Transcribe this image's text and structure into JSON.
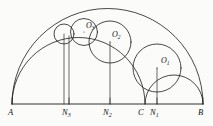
{
  "figure": {
    "background_color": "#fbfbfa",
    "ink_color": "#1a1a1a"
  },
  "chart_data": {
    "type": "diagram",
    "xlabel": "",
    "ylabel": "",
    "baseline": {
      "from_point": "A",
      "to_point": "B",
      "y": 104,
      "x_start": 12,
      "x_end": 203
    },
    "points": [
      {
        "id": "A",
        "label": "A",
        "x": 12,
        "y": 104,
        "label_x": 9,
        "label_y": 107
      },
      {
        "id": "N3",
        "label": "N3",
        "x": 69,
        "y": 104,
        "label_x": 63,
        "label_y": 107
      },
      {
        "id": "N2",
        "label": "N2",
        "x": 110,
        "y": 104,
        "label_x": 104,
        "label_y": 107
      },
      {
        "id": "C",
        "label": "C",
        "x": 145,
        "y": 104,
        "label_x": 140,
        "label_y": 107
      },
      {
        "id": "N1",
        "label": "N1",
        "x": 157,
        "y": 104,
        "label_x": 151,
        "label_y": 107
      },
      {
        "id": "B",
        "label": "B",
        "x": 203,
        "y": 104,
        "label_x": 199,
        "label_y": 107
      }
    ],
    "semicircles": [
      {
        "name": "outer-semicircle-AB",
        "from": "A",
        "to": "B",
        "cx": 107.5,
        "cy": 104,
        "r": 95.5
      },
      {
        "name": "inner-semicircle-AC",
        "from": "A",
        "to": "C",
        "cx": 78.5,
        "cy": 104,
        "r": 66.5
      },
      {
        "name": "inner-semicircle-CB",
        "from": "C",
        "to": "B",
        "cx": 174,
        "cy": 104,
        "r": 29
      }
    ],
    "chain_circles": [
      {
        "name": "circle-O1",
        "label": "O1",
        "cx": 157,
        "cy": 68,
        "r": 24,
        "foot": "N1",
        "label_x": 161,
        "label_y": 62,
        "show_label": true
      },
      {
        "name": "circle-O2",
        "label": "O2",
        "cx": 110,
        "cy": 42,
        "r": 21,
        "foot": "N2",
        "label_x": 114,
        "label_y": 36,
        "show_label": true
      },
      {
        "name": "circle-O3",
        "label": "O3",
        "cx": 84,
        "cy": 32,
        "r": 13.5,
        "foot": "N3",
        "label_x": 88,
        "label_y": 26,
        "show_label": true
      },
      {
        "name": "circle-O4",
        "label": "",
        "cx": 64,
        "cy": 34,
        "r": 10,
        "foot": "N4",
        "label_x": 0,
        "label_y": 0,
        "show_label": false
      }
    ],
    "perpendiculars": [
      {
        "name": "perp-O1-N1",
        "x": 157,
        "y_top": 68,
        "y_bottom": 104
      },
      {
        "name": "perp-O2-N2",
        "x": 110,
        "y_top": 42,
        "y_bottom": 104
      },
      {
        "name": "perp-O3-N3",
        "x": 69,
        "y_top": 36,
        "y_bottom": 104
      },
      {
        "name": "perp-O4-N4",
        "x": 64,
        "y_top": 34,
        "y_bottom": 104
      }
    ]
  }
}
